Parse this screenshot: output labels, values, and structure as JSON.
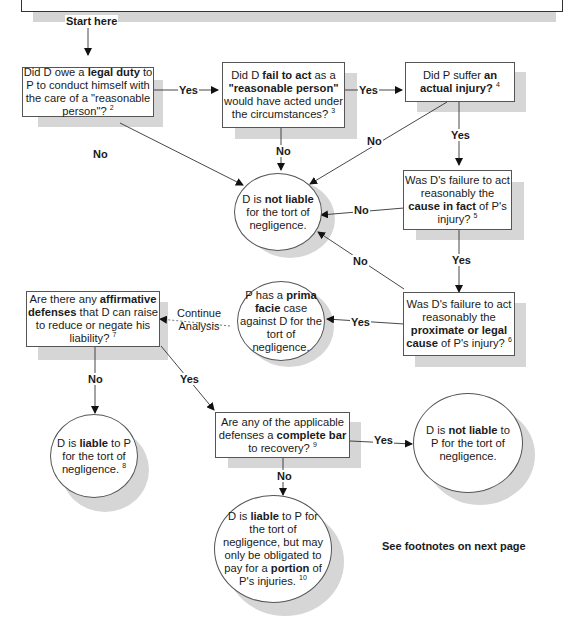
{
  "start_label": "Start here",
  "continue_label": "Continue Analysis",
  "footer_note": "See footnotes on next page",
  "edge_labels": {
    "yes": "Yes",
    "no": "No"
  },
  "nodes": {
    "q1": {
      "parts": [
        "Did D owe a ",
        "legal duty",
        " to P to conduct himself with the care of a \"reasonable person\"?"
      ],
      "footnote": "2"
    },
    "q2": {
      "parts": [
        "Did D ",
        "fail to act",
        " as a ",
        "\"reasonable person\"",
        " would have acted under the circumstances?"
      ],
      "footnote": "3"
    },
    "q3": {
      "parts": [
        "Did P suffer ",
        "an actual injury?"
      ],
      "footnote": "4"
    },
    "q4": {
      "parts": [
        "Was D's failure to act reasonably the ",
        "cause in fact",
        " of P's injury?"
      ],
      "footnote": "5"
    },
    "q5": {
      "parts": [
        "Was D's failure to act reasonably the ",
        "proximate or legal cause",
        " of P's injury?"
      ],
      "footnote": "6"
    },
    "q6": {
      "parts": [
        "Are there any ",
        "affirmative defenses",
        " that D can raise to reduce or negate his liability?"
      ],
      "footnote": "7"
    },
    "q7": {
      "parts": [
        "Are any of the applicable defenses a ",
        "complete bar",
        " to recovery?"
      ],
      "footnote": "9"
    },
    "r_not_liable": {
      "parts": [
        "D is ",
        "not liable",
        " for the tort of negligence."
      ]
    },
    "r_prima_facie": {
      "parts": [
        "P has a ",
        "prima facie",
        " case against D for the tort of negligence."
      ]
    },
    "r_liable": {
      "parts": [
        "D is ",
        "liable",
        " to P for the tort of negligence."
      ],
      "footnote": "8"
    },
    "r_not_liable_bar": {
      "parts": [
        "D is ",
        "not liable",
        " to P for the tort of negligence."
      ]
    },
    "r_partial": {
      "parts": [
        "D is ",
        "liable",
        " to P for the tort of negligence, but may only be obligated to pay for a ",
        "portion",
        " of P's injuries."
      ],
      "footnote": "10"
    }
  }
}
